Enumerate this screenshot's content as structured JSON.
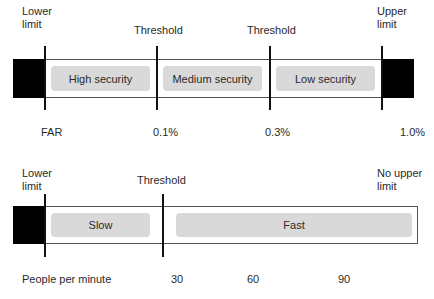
{
  "far_scale": {
    "lower_limit_label": "Lower limit",
    "upper_limit_label": "Upper limit",
    "threshold_labels": [
      "Threshold",
      "Threshold"
    ],
    "zones": [
      "High security",
      "Medium security",
      "Low security"
    ],
    "axis_label": "FAR",
    "ticks": [
      "0.1%",
      "0.3%",
      "1.0%"
    ]
  },
  "throughput_scale": {
    "lower_limit_label": "Lower limit",
    "upper_limit_label": "No upper limit",
    "threshold_label": "Threshold",
    "zones": [
      "Slow",
      "Fast"
    ],
    "axis_label": "People per minute",
    "ticks": [
      "30",
      "60",
      "90"
    ]
  },
  "colors": {
    "limit_block": "#000000",
    "zone_fill": "#d9d9d9",
    "bar_border": "#555555",
    "threshold_line": "#111111"
  }
}
